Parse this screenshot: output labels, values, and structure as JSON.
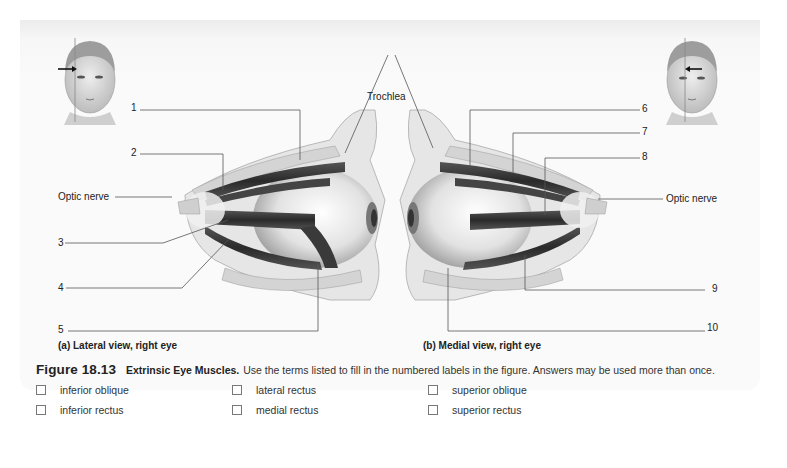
{
  "figure": {
    "number": "Figure 18.13",
    "title": "Extrinsic Eye Muscles.",
    "instructions": "Use the terms listed to fill in the numbered labels in the figure. Answers may be used more than once."
  },
  "panels": {
    "a": {
      "caption": "(a) Lateral view, right eye",
      "optic_nerve": "Optic nerve"
    },
    "b": {
      "caption": "(b) Medial view, right eye",
      "optic_nerve": "Optic nerve"
    },
    "trochlea": "Trochlea"
  },
  "labels": [
    "1",
    "2",
    "3",
    "4",
    "5",
    "6",
    "7",
    "8",
    "9",
    "10"
  ],
  "terms": [
    {
      "label": "inferior oblique",
      "checked": false
    },
    {
      "label": "lateral rectus",
      "checked": false
    },
    {
      "label": "superior oblique",
      "checked": false
    },
    {
      "label": "inferior rectus",
      "checked": false
    },
    {
      "label": "medial rectus",
      "checked": false
    },
    {
      "label": "superior rectus",
      "checked": false
    }
  ],
  "colors": {
    "panel_bg": "#f4f4f4",
    "line": "#555555",
    "muscle": "#3a3a3a",
    "bone": "#d9d9d9"
  }
}
